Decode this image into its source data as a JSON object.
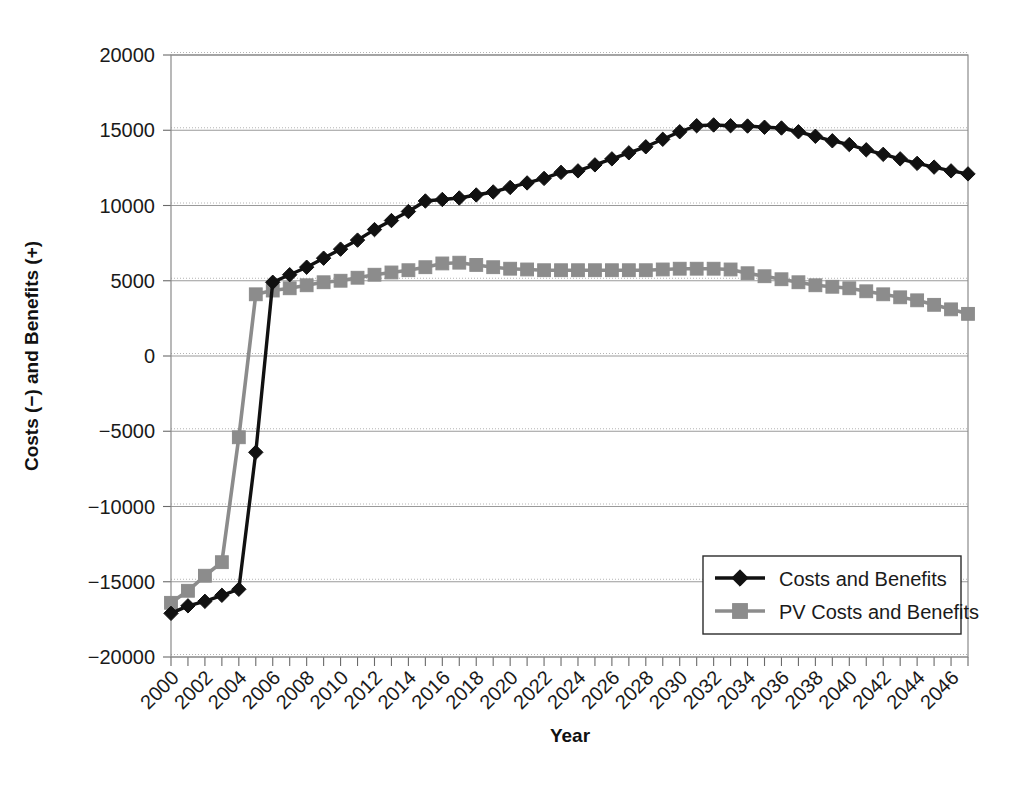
{
  "chart_data": {
    "type": "line",
    "title": "",
    "xlabel": "Year",
    "ylabel": "Costs (−) and Benefits (+)",
    "xlim": [
      2000,
      2047
    ],
    "ylim": [
      -20000,
      20000
    ],
    "ytick_values": [
      20000,
      15000,
      10000,
      5000,
      0,
      -5000,
      -10000,
      -15000,
      -20000
    ],
    "ytick_labels": [
      "20000",
      "15000",
      "10000",
      "5000",
      "0",
      "−5000",
      "−10000",
      "−15000",
      "−20000"
    ],
    "xtick_values": [
      2000,
      2002,
      2004,
      2006,
      2008,
      2010,
      2012,
      2014,
      2016,
      2018,
      2020,
      2022,
      2024,
      2026,
      2028,
      2030,
      2032,
      2034,
      2036,
      2038,
      2040,
      2042,
      2044,
      2046
    ],
    "xtick_labels": [
      "2000",
      "2002",
      "2004",
      "2006",
      "2008",
      "2010",
      "2012",
      "2014",
      "2016",
      "2018",
      "2020",
      "2022",
      "2024",
      "2026",
      "2028",
      "2030",
      "2032",
      "2034",
      "2036",
      "2038",
      "2040",
      "2042",
      "2044",
      "2046"
    ],
    "grid": true,
    "legend_position": "lower right",
    "x": [
      2000,
      2001,
      2002,
      2003,
      2004,
      2005,
      2006,
      2007,
      2008,
      2009,
      2010,
      2011,
      2012,
      2013,
      2014,
      2015,
      2016,
      2017,
      2018,
      2019,
      2020,
      2021,
      2022,
      2023,
      2024,
      2025,
      2026,
      2027,
      2028,
      2029,
      2030,
      2031,
      2032,
      2033,
      2034,
      2035,
      2036,
      2037,
      2038,
      2039,
      2040,
      2041,
      2042,
      2043,
      2044,
      2045,
      2046,
      2047
    ],
    "series": [
      {
        "name": "Costs and Benefits",
        "color": "#111111",
        "marker": "diamond",
        "values": [
          -17100,
          -16600,
          -16300,
          -15900,
          -15500,
          -6400,
          4900,
          5400,
          5900,
          6500,
          7100,
          7700,
          8400,
          9000,
          9600,
          10300,
          10400,
          10500,
          10700,
          10900,
          11200,
          11500,
          11800,
          12200,
          12300,
          12700,
          13100,
          13500,
          13900,
          14400,
          14900,
          15300,
          15350,
          15300,
          15280,
          15200,
          15150,
          14900,
          14600,
          14300,
          14050,
          13700,
          13400,
          13100,
          12800,
          12550,
          12300,
          12100
        ]
      },
      {
        "name": "PV Costs and Benefits",
        "color": "#8c8c8c",
        "marker": "square",
        "values": [
          -16400,
          -15600,
          -14600,
          -13700,
          -5400,
          4100,
          4350,
          4500,
          4700,
          4900,
          5000,
          5200,
          5400,
          5550,
          5700,
          5900,
          6150,
          6200,
          6050,
          5900,
          5800,
          5750,
          5700,
          5700,
          5700,
          5700,
          5700,
          5700,
          5700,
          5750,
          5800,
          5800,
          5800,
          5750,
          5500,
          5300,
          5100,
          4900,
          4700,
          4600,
          4500,
          4300,
          4100,
          3900,
          3700,
          3400,
          3100,
          2800
        ]
      }
    ]
  },
  "legend": {
    "items": [
      {
        "label": "Costs and Benefits",
        "marker": "diamond",
        "color": "#111111"
      },
      {
        "label": "PV Costs and Benefits",
        "marker": "square",
        "color": "#8c8c8c"
      }
    ]
  }
}
